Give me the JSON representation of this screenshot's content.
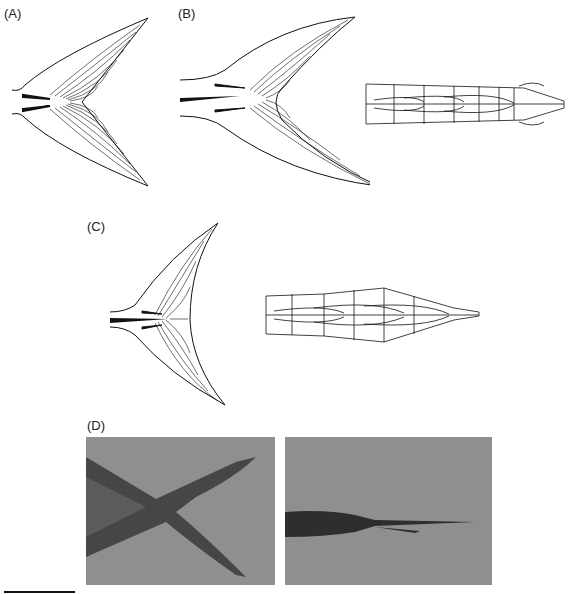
{
  "figure": {
    "panels": [
      {
        "id": "A",
        "label": "(A)",
        "content": "forked caudal fin line drawing"
      },
      {
        "id": "B",
        "label": "(B)",
        "content": "lunate caudal fin line drawing with caudal skeleton (vertebrae) drawing"
      },
      {
        "id": "C",
        "label": "(C)",
        "content": "deeply lunate caudal fin line drawing with caudal skeleton (vertebrae) drawing"
      },
      {
        "id": "D",
        "label": "(D)",
        "content": "photographs: caudal fin lateral view and caudal peduncle dorsal view"
      }
    ],
    "scale_bar": {
      "present": true
    }
  },
  "colors": {
    "ink": "#111111",
    "photo_bg": "#8f8f8f",
    "photo_fish_dark": "#3a3a3a"
  }
}
